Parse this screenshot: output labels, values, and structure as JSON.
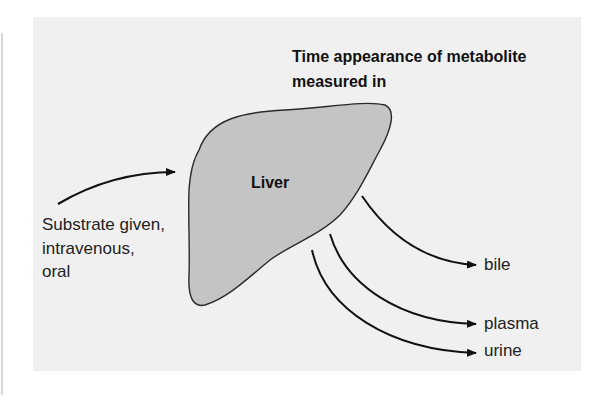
{
  "figure": {
    "title_line1": "Time appearance of metabolite",
    "title_line2": "measured in",
    "organ": {
      "label": "Liver",
      "fill": "#c4c4c4",
      "stroke": "#2a2a2a"
    },
    "source": {
      "line1": "Substrate given,",
      "line2": "intravenous,",
      "line3": "oral"
    },
    "destinations": [
      {
        "label": "bile"
      },
      {
        "label": "plasma"
      },
      {
        "label": "urine"
      }
    ],
    "colors": {
      "panel": "#f0f0f0",
      "arrow": "#111111"
    }
  }
}
